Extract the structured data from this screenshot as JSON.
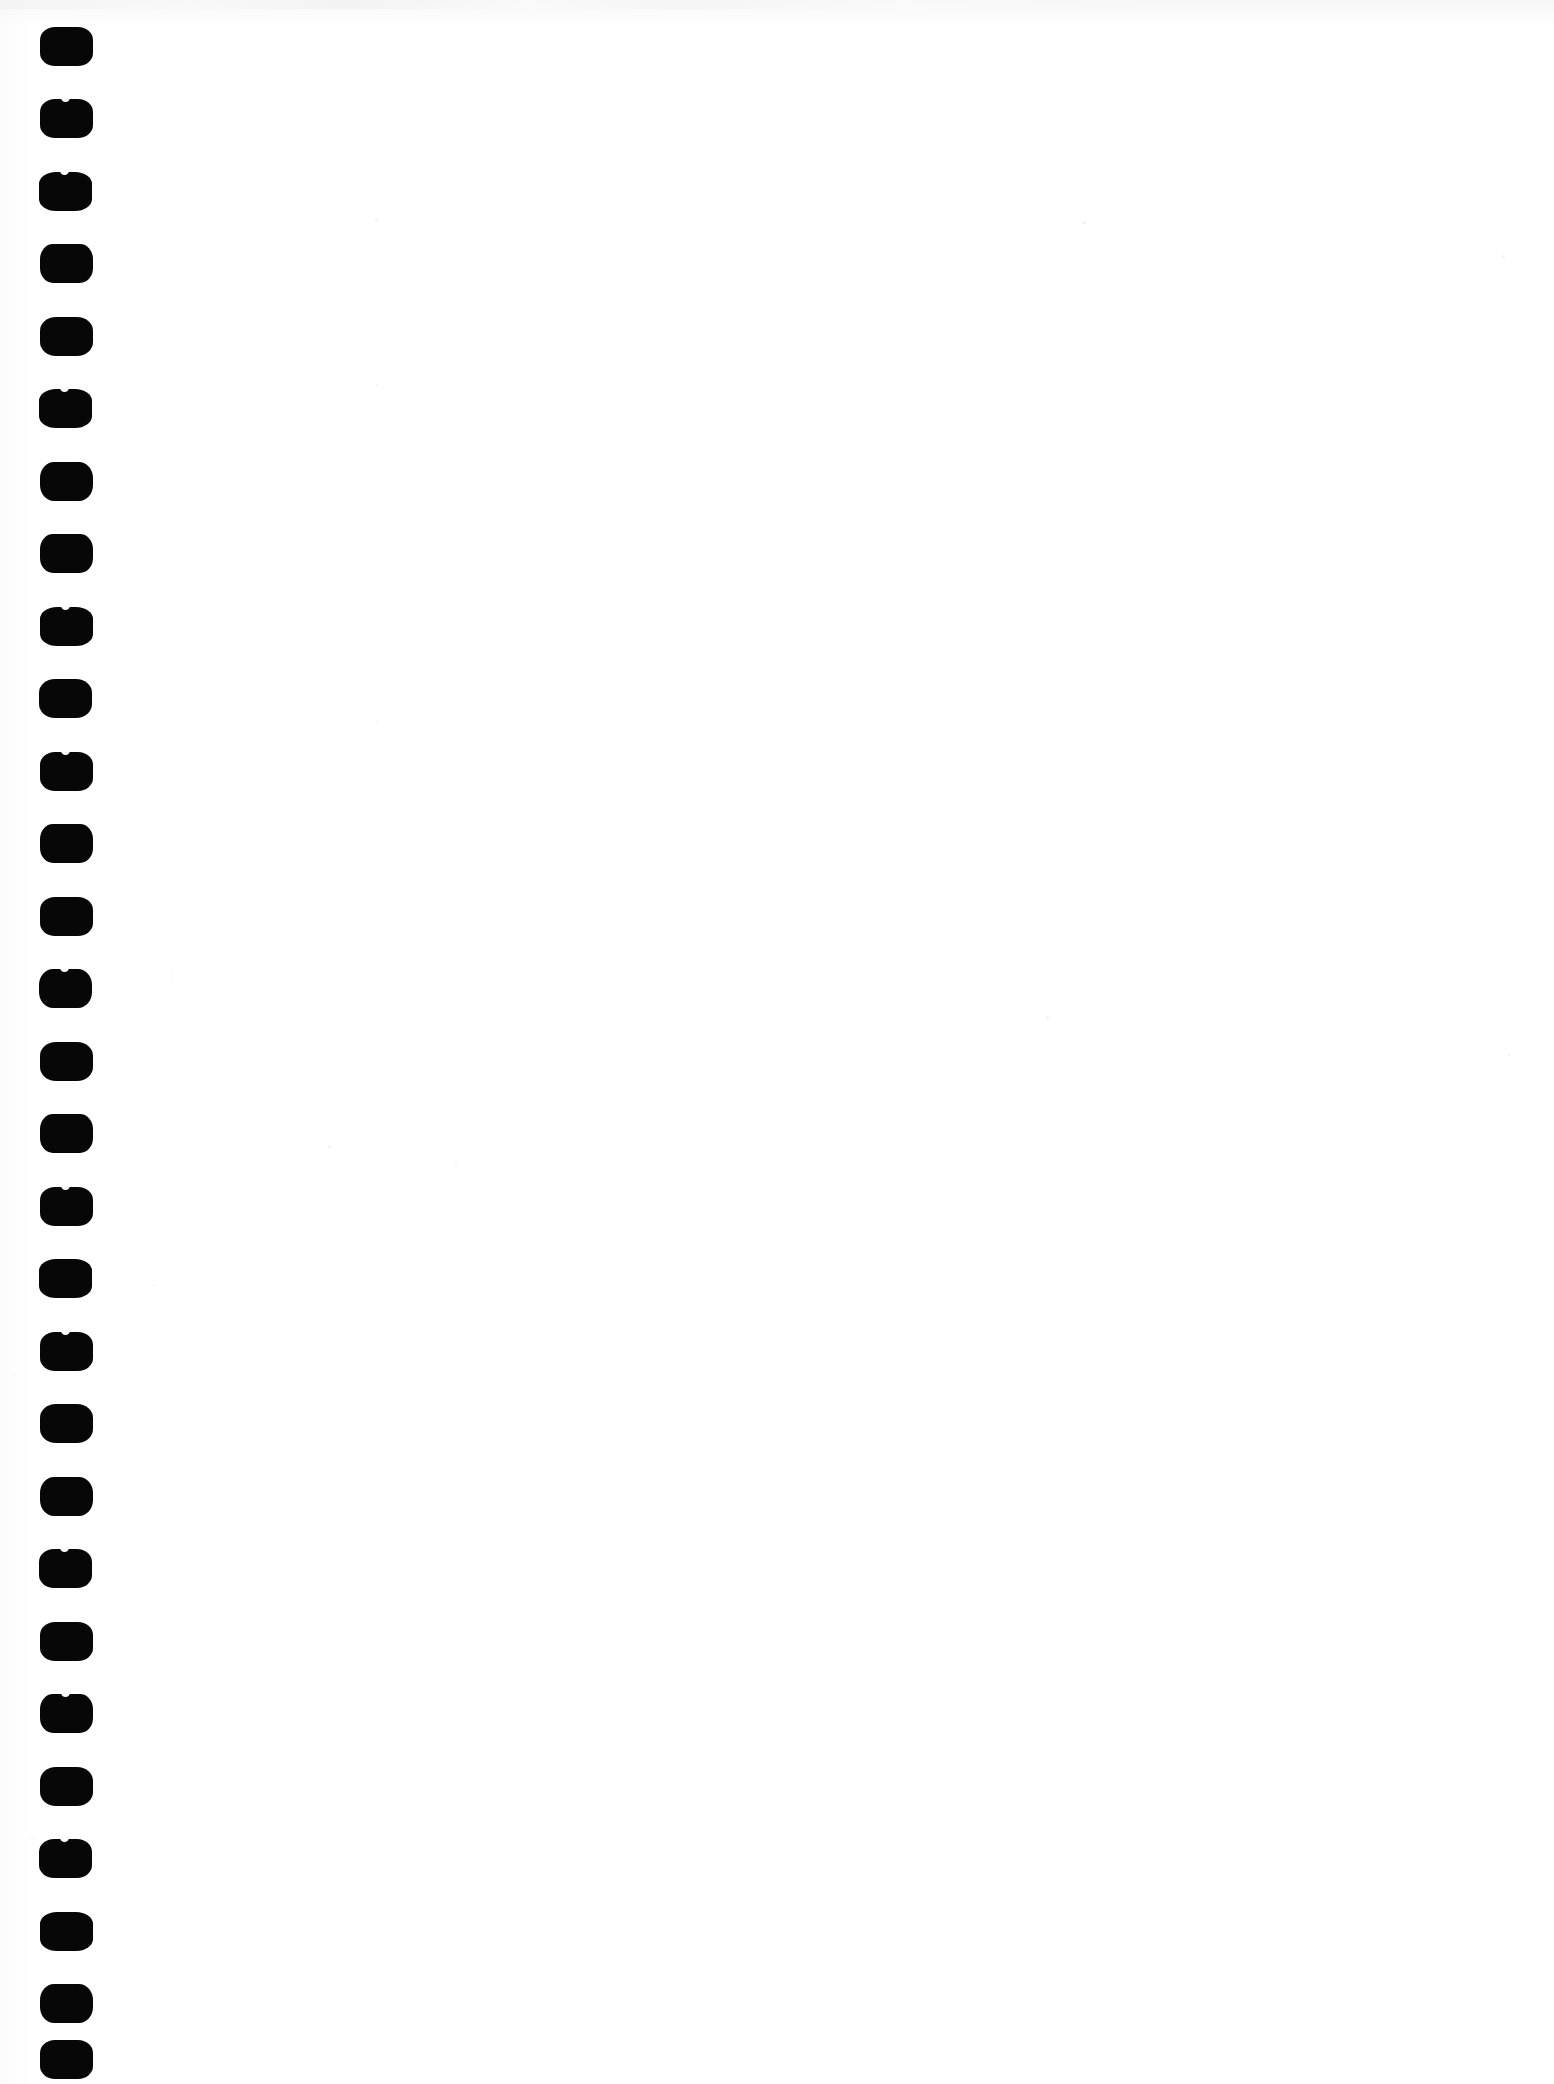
{
  "document": {
    "kind": "scanned-page",
    "title": "Scanned blank notebook page",
    "page_width": 1554,
    "page_height": 2084,
    "page_color": "#ffffff",
    "ink_color": "#070707",
    "body_text": "",
    "body_note": "blank page — no printed or handwritten content",
    "has_visible_text": false
  },
  "binding": {
    "type": "spiral-comb-punch",
    "edge": "left",
    "hole_shape": "rounded-rectangle",
    "hole_count": 29,
    "hole_width": 53,
    "hole_height": 39,
    "hole_left_x": 40,
    "first_hole_y": 27,
    "pitch_y": 72.5,
    "hole_color": "#070707",
    "holes": [
      {
        "index": 1,
        "x": 40,
        "y": 27,
        "nick": false
      },
      {
        "index": 2,
        "x": 40,
        "y": 99,
        "nick": true
      },
      {
        "index": 3,
        "x": 39,
        "y": 172,
        "nick": true
      },
      {
        "index": 4,
        "x": 40,
        "y": 244,
        "nick": false
      },
      {
        "index": 5,
        "x": 40,
        "y": 317,
        "nick": false
      },
      {
        "index": 6,
        "x": 39,
        "y": 389,
        "nick": true
      },
      {
        "index": 7,
        "x": 40,
        "y": 462,
        "nick": false
      },
      {
        "index": 8,
        "x": 40,
        "y": 534,
        "nick": false
      },
      {
        "index": 9,
        "x": 40,
        "y": 607,
        "nick": true
      },
      {
        "index": 10,
        "x": 39,
        "y": 679,
        "nick": false
      },
      {
        "index": 11,
        "x": 40,
        "y": 752,
        "nick": true
      },
      {
        "index": 12,
        "x": 40,
        "y": 824,
        "nick": false
      },
      {
        "index": 13,
        "x": 40,
        "y": 897,
        "nick": false
      },
      {
        "index": 14,
        "x": 39,
        "y": 969,
        "nick": true
      },
      {
        "index": 15,
        "x": 40,
        "y": 1042,
        "nick": false
      },
      {
        "index": 16,
        "x": 40,
        "y": 1114,
        "nick": false
      },
      {
        "index": 17,
        "x": 40,
        "y": 1187,
        "nick": true
      },
      {
        "index": 18,
        "x": 39,
        "y": 1259,
        "nick": false
      },
      {
        "index": 19,
        "x": 40,
        "y": 1332,
        "nick": true
      },
      {
        "index": 20,
        "x": 40,
        "y": 1404,
        "nick": false
      },
      {
        "index": 21,
        "x": 40,
        "y": 1477,
        "nick": false
      },
      {
        "index": 22,
        "x": 39,
        "y": 1549,
        "nick": true
      },
      {
        "index": 23,
        "x": 40,
        "y": 1622,
        "nick": false
      },
      {
        "index": 24,
        "x": 40,
        "y": 1694,
        "nick": true
      },
      {
        "index": 25,
        "x": 40,
        "y": 1767,
        "nick": false
      },
      {
        "index": 26,
        "x": 39,
        "y": 1839,
        "nick": true
      },
      {
        "index": 27,
        "x": 40,
        "y": 1912,
        "nick": false
      },
      {
        "index": 28,
        "x": 40,
        "y": 1984,
        "nick": false
      },
      {
        "index": 29,
        "x": 40,
        "y": 2040,
        "nick": false
      }
    ]
  },
  "artifacts": {
    "top_scan_band": true,
    "specks": [
      {
        "x": 375,
        "y": 219,
        "size": 3
      },
      {
        "x": 1083,
        "y": 221,
        "size": 3
      },
      {
        "x": 376,
        "y": 384,
        "size": 2
      },
      {
        "x": 376,
        "y": 721,
        "size": 2
      },
      {
        "x": 328,
        "y": 1145,
        "size": 3
      },
      {
        "x": 1046,
        "y": 1016,
        "size": 3
      },
      {
        "x": 455,
        "y": 1162,
        "size": 2
      },
      {
        "x": 1502,
        "y": 255,
        "size": 3
      },
      {
        "x": 1508,
        "y": 1054,
        "size": 2
      },
      {
        "x": 153,
        "y": 1284,
        "size": 2
      },
      {
        "x": 171,
        "y": 975,
        "size": 2
      },
      {
        "x": 14,
        "y": 1373,
        "size": 2
      },
      {
        "x": 31,
        "y": 1837,
        "size": 2
      }
    ]
  }
}
